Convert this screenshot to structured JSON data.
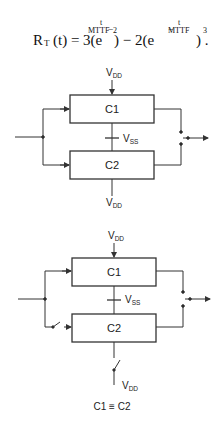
{
  "equation": {
    "lhs": "R",
    "lhs_sub": "T",
    "lhs_arg": "(t) = 3(e",
    "exp_num": "t",
    "exp_den": "MTTF",
    "exp_sign": "−",
    "power1": "2",
    "middle": ") − 2(e",
    "power2": "3",
    "end": ") .",
    "full_text": "R_T(t) = 3(e^(-t/MTTF))^2 - 2(e^(-t/MTTF))^3."
  },
  "diagram1": {
    "top_supply": {
      "main": "V",
      "sub": "DD"
    },
    "block1": "C1",
    "mid_supply": {
      "main": "V",
      "sub": "SS"
    },
    "block2": "C2",
    "bottom_supply": {
      "main": "V",
      "sub": "DD"
    }
  },
  "diagram2": {
    "top_supply": {
      "main": "V",
      "sub": "DD"
    },
    "block1": "C1",
    "mid_supply": {
      "main": "V",
      "sub": "SS"
    },
    "block2": "C2",
    "bottom_supply": {
      "main": "V",
      "sub": "DD"
    },
    "caption": "C1 ≡ C2"
  }
}
